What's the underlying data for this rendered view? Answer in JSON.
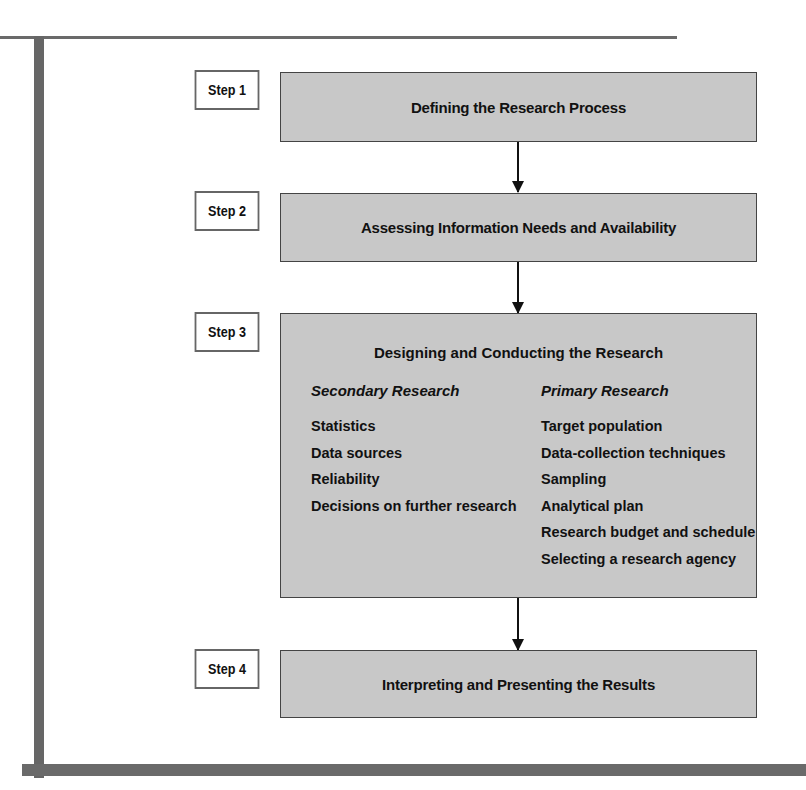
{
  "diagram": {
    "type": "flowchart",
    "steps": [
      {
        "label": "Step 1",
        "title": "Defining the Research Process"
      },
      {
        "label": "Step 2",
        "title": "Assessing Information Needs and Availability"
      },
      {
        "label": "Step 3",
        "title": "Designing and Conducting the Research",
        "columns": [
          {
            "heading": "Secondary Research",
            "items": [
              "Statistics",
              "Data sources",
              "Reliability",
              "Decisions on further research"
            ]
          },
          {
            "heading": "Primary Research",
            "items": [
              "Target population",
              "Data-collection techniques",
              "Sampling",
              "Analytical plan",
              "Research budget and schedule",
              "Selecting a research agency"
            ]
          }
        ]
      },
      {
        "label": "Step 4",
        "title": "Interpreting and Presenting the Results"
      }
    ],
    "colors": {
      "box_fill": "#c8c8c8",
      "frame": "#666666",
      "arrow": "#111111"
    }
  }
}
